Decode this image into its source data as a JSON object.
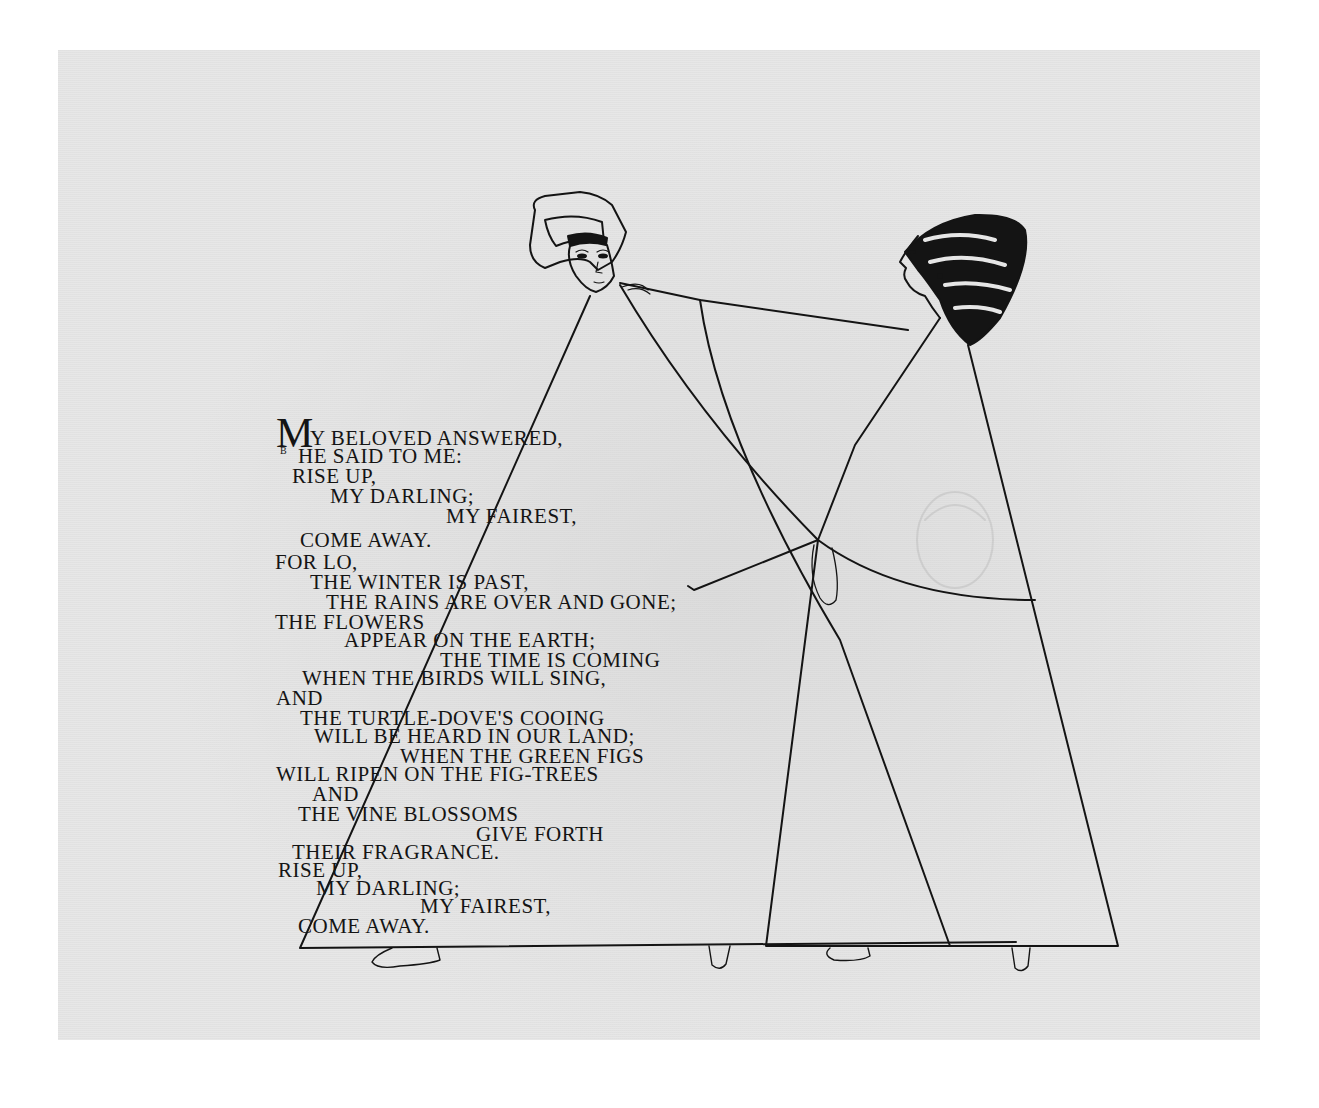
{
  "page": {
    "background": "#e6e6e6",
    "ink": "#141414"
  },
  "poem": {
    "initial": "M",
    "initial_small": "B",
    "lines": [
      {
        "text": "y beloved answered,",
        "x": 310,
        "y": 428
      },
      {
        "text": "he said to me:",
        "x": 298,
        "y": 446
      },
      {
        "text": "rise up,",
        "x": 292,
        "y": 466
      },
      {
        "text": "my darling;",
        "x": 330,
        "y": 486
      },
      {
        "text": "my fairest,",
        "x": 446,
        "y": 506
      },
      {
        "text": "come away.",
        "x": 300,
        "y": 530
      },
      {
        "text": "for lo,",
        "x": 275,
        "y": 552
      },
      {
        "text": "the winter is past,",
        "x": 310,
        "y": 572
      },
      {
        "text": "the rains are over and gone;",
        "x": 326,
        "y": 592
      },
      {
        "text": "the flowers",
        "x": 275,
        "y": 612
      },
      {
        "text": "appear on the earth;",
        "x": 344,
        "y": 630
      },
      {
        "text": "the time is coming",
        "x": 440,
        "y": 650
      },
      {
        "text": "when the birds will sing,",
        "x": 302,
        "y": 668
      },
      {
        "text": "and",
        "x": 276,
        "y": 688
      },
      {
        "text": "the turtle-dove's cooing",
        "x": 300,
        "y": 708
      },
      {
        "text": "will be heard in our land;",
        "x": 314,
        "y": 726
      },
      {
        "text": "when the green figs",
        "x": 400,
        "y": 746
      },
      {
        "text": "will ripen on the fig-trees",
        "x": 276,
        "y": 764
      },
      {
        "text": "and",
        "x": 312,
        "y": 784
      },
      {
        "text": "the vine blossoms",
        "x": 298,
        "y": 804
      },
      {
        "text": "give forth",
        "x": 476,
        "y": 824
      },
      {
        "text": "their fragrance.",
        "x": 292,
        "y": 842
      },
      {
        "text": "rise up,",
        "x": 278,
        "y": 860
      },
      {
        "text": "my darling;",
        "x": 316,
        "y": 878
      },
      {
        "text": "my fairest,",
        "x": 420,
        "y": 896
      },
      {
        "text": "come away.",
        "x": 298,
        "y": 916
      }
    ]
  },
  "illustration": {
    "subject": "two robed figures holding hands; man in turban at left, woman with striped headdress at right reaching to his shoulder"
  }
}
